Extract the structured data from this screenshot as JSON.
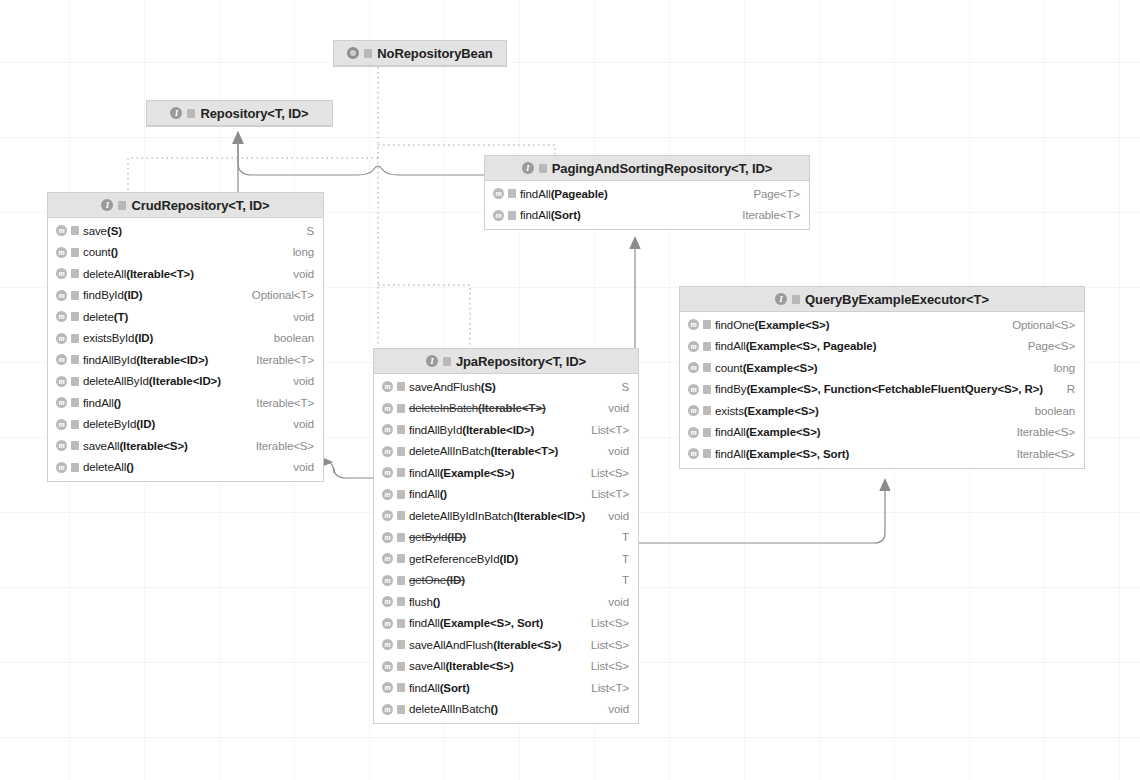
{
  "diagram": {
    "icons": {
      "interface": "interface-icon",
      "annotation": "annotation-icon",
      "method": "method-icon",
      "visibility": "visibility-icon"
    },
    "colors": {
      "header_bg": "#e3e3e3",
      "box_bg": "#ffffff",
      "border": "#cfcfcf",
      "text": "#1a1a1a",
      "return_type_text": "#8a8a8a",
      "edge": "#707070",
      "grid": "#f0f0f0"
    }
  },
  "nodes": {
    "no_repository_bean": {
      "name": "NoRepositoryBean",
      "kind": "annotation",
      "x": 333,
      "y": 40,
      "width": 174,
      "members": []
    },
    "repository": {
      "name": "Repository<T, ID>",
      "kind": "interface",
      "x": 146,
      "y": 100,
      "width": 187,
      "members": []
    },
    "paging_and_sorting_repository": {
      "name": "PagingAndSortingRepository<T, ID>",
      "kind": "interface",
      "x": 484,
      "y": 155,
      "width": 326,
      "members": [
        {
          "signature": "findAll",
          "params": "(Pageable)",
          "type": "Page<T>",
          "deprecated": false
        },
        {
          "signature": "findAll",
          "params": "(Sort)",
          "type": "Iterable<T>",
          "deprecated": false
        }
      ]
    },
    "crud_repository": {
      "name": "CrudRepository<T, ID>",
      "kind": "interface",
      "x": 47,
      "y": 192,
      "width": 277,
      "members": [
        {
          "signature": "save",
          "params": "(S)",
          "type": "S",
          "deprecated": false
        },
        {
          "signature": "count",
          "params": "()",
          "type": "long",
          "deprecated": false
        },
        {
          "signature": "deleteAll",
          "params": "(Iterable<T>)",
          "type": "void",
          "deprecated": false
        },
        {
          "signature": "findById",
          "params": "(ID)",
          "type": "Optional<T>",
          "deprecated": false
        },
        {
          "signature": "delete",
          "params": "(T)",
          "type": "void",
          "deprecated": false
        },
        {
          "signature": "existsById",
          "params": "(ID)",
          "type": "boolean",
          "deprecated": false
        },
        {
          "signature": "findAllById",
          "params": "(Iterable<ID>)",
          "type": "Iterable<T>",
          "deprecated": false
        },
        {
          "signature": "deleteAllById",
          "params": "(Iterable<ID>)",
          "type": "void",
          "deprecated": false
        },
        {
          "signature": "findAll",
          "params": "()",
          "type": "Iterable<T>",
          "deprecated": false
        },
        {
          "signature": "deleteById",
          "params": "(ID)",
          "type": "void",
          "deprecated": false
        },
        {
          "signature": "saveAll",
          "params": "(Iterable<S>)",
          "type": "Iterable<S>",
          "deprecated": false
        },
        {
          "signature": "deleteAll",
          "params": "()",
          "type": "void",
          "deprecated": false
        }
      ]
    },
    "jpa_repository": {
      "name": "JpaRepository<T, ID>",
      "kind": "interface",
      "x": 373,
      "y": 348,
      "width": 266,
      "members": [
        {
          "signature": "saveAndFlush",
          "params": "(S)",
          "type": "S",
          "deprecated": false
        },
        {
          "signature": "deleteInBatch",
          "params": "(Iterable<T>)",
          "type": "void",
          "deprecated": true
        },
        {
          "signature": "findAllById",
          "params": "(Iterable<ID>)",
          "type": "List<T>",
          "deprecated": false
        },
        {
          "signature": "deleteAllInBatch",
          "params": "(Iterable<T>)",
          "type": "void",
          "deprecated": false
        },
        {
          "signature": "findAll",
          "params": "(Example<S>)",
          "type": "List<S>",
          "deprecated": false
        },
        {
          "signature": "findAll",
          "params": "()",
          "type": "List<T>",
          "deprecated": false
        },
        {
          "signature": "deleteAllByIdInBatch",
          "params": "(Iterable<ID>)",
          "type": "void",
          "deprecated": false
        },
        {
          "signature": "getById",
          "params": "(ID)",
          "type": "T",
          "deprecated": true
        },
        {
          "signature": "getReferenceById",
          "params": "(ID)",
          "type": "T",
          "deprecated": false
        },
        {
          "signature": "getOne",
          "params": "(ID)",
          "type": "T",
          "deprecated": true
        },
        {
          "signature": "flush",
          "params": "()",
          "type": "void",
          "deprecated": false
        },
        {
          "signature": "findAll",
          "params": "(Example<S>, Sort)",
          "type": "List<S>",
          "deprecated": false
        },
        {
          "signature": "saveAllAndFlush",
          "params": "(Iterable<S>)",
          "type": "List<S>",
          "deprecated": false
        },
        {
          "signature": "saveAll",
          "params": "(Iterable<S>)",
          "type": "List<S>",
          "deprecated": false
        },
        {
          "signature": "findAll",
          "params": "(Sort)",
          "type": "List<T>",
          "deprecated": false
        },
        {
          "signature": "deleteAllInBatch",
          "params": "()",
          "type": "void",
          "deprecated": false
        }
      ]
    },
    "query_by_example_executor": {
      "name": "QueryByExampleExecutor<T>",
      "kind": "interface",
      "x": 679,
      "y": 286,
      "width": 406,
      "members": [
        {
          "signature": "findOne",
          "params": "(Example<S>)",
          "type": "Optional<S>",
          "deprecated": false
        },
        {
          "signature": "findAll",
          "params": "(Example<S>, Pageable)",
          "type": "Page<S>",
          "deprecated": false
        },
        {
          "signature": "count",
          "params": "(Example<S>)",
          "type": "long",
          "deprecated": false
        },
        {
          "signature": "findBy",
          "params": "(Example<S>, Function<FetchableFluentQuery<S>, R>)",
          "type": "R",
          "deprecated": false
        },
        {
          "signature": "exists",
          "params": "(Example<S>)",
          "type": "boolean",
          "deprecated": false
        },
        {
          "signature": "findAll",
          "params": "(Example<S>)",
          "type": "Iterable<S>",
          "deprecated": false
        },
        {
          "signature": "findAll",
          "params": "(Example<S>, Sort)",
          "type": "Iterable<S>",
          "deprecated": false
        }
      ]
    }
  },
  "edges": [
    {
      "name": "crud-to-repository",
      "from": "crud_repository",
      "to": "repository",
      "style": "inheritance"
    },
    {
      "name": "paging-to-repository",
      "from": "paging_and_sorting_repository",
      "to": "repository",
      "style": "inheritance"
    },
    {
      "name": "jpa-to-paging",
      "from": "jpa_repository",
      "to": "paging_and_sorting_repository",
      "style": "inheritance"
    },
    {
      "name": "jpa-to-crud",
      "from": "jpa_repository",
      "to": "crud_repository",
      "style": "inheritance"
    },
    {
      "name": "jpa-to-qbe",
      "from": "jpa_repository",
      "to": "query_by_example_executor",
      "style": "inheritance"
    },
    {
      "name": "norepositorybean-to-crud",
      "from": "no_repository_bean",
      "to": "crud_repository",
      "style": "annotation"
    },
    {
      "name": "norepositorybean-to-paging",
      "from": "no_repository_bean",
      "to": "paging_and_sorting_repository",
      "style": "annotation"
    },
    {
      "name": "norepositorybean-to-jpa",
      "from": "no_repository_bean",
      "to": "jpa_repository",
      "style": "annotation"
    }
  ]
}
